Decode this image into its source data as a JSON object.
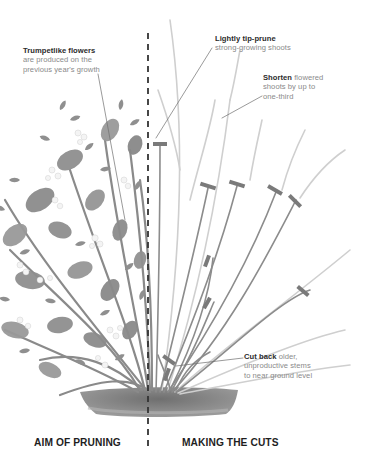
{
  "diagram": {
    "left_panel": {
      "caption": "AIM OF PRUNING",
      "annotation": {
        "bold": "Trumpetlike flowers",
        "text_line1": "are produced on the",
        "text_line2": "previous year's growth"
      }
    },
    "right_panel": {
      "caption": "MAKING THE CUTS",
      "annotations": [
        {
          "bold": "Lightly tip-prune",
          "rest": "",
          "line2": "strong-growing shoots",
          "line3": ""
        },
        {
          "bold": "Shorten",
          "rest": " flowered",
          "line2": "shoots by up to",
          "line3": "one-third"
        },
        {
          "bold": "Cut back",
          "rest": " older,",
          "line2": "unproductive stems",
          "line3": "to near ground level"
        }
      ]
    },
    "divider": "dashed-vertical-line",
    "colors": {
      "foliage": "#8f8f8f",
      "stem_dark": "#8a8a8a",
      "stem_light": "#cfcfcf",
      "cut_mark": "#7a7a7a",
      "soil": "#7d7d7d",
      "divider": "#333333",
      "text_bold": "#2b2b2b",
      "text_regular": "#8a8a8a"
    }
  }
}
